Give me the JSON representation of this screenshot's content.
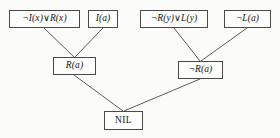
{
  "figure": {
    "type": "resolution-refutation-tree",
    "background_color": "#fbfbfa",
    "line_color": "#4a4a4a",
    "text_color": "#161616"
  },
  "nodes": {
    "clause1": {
      "label": "¬I(x)∨R(x)",
      "row": "premises"
    },
    "clause2": {
      "label": "I(a)",
      "row": "premises"
    },
    "clause3": {
      "label": "¬R(y)∨L(y)",
      "row": "premises"
    },
    "clause4": {
      "label": "¬L(a)",
      "row": "premises"
    },
    "resolvent1": {
      "label": "R(a)",
      "row": "intermediate"
    },
    "resolvent2": {
      "label": "¬R(a)",
      "row": "intermediate"
    },
    "nil": {
      "label": "NIL",
      "row": "conclusion"
    }
  },
  "edges": [
    {
      "from": "clause1",
      "to": "resolvent1",
      "x1": 44,
      "y1": 28,
      "x2": 74,
      "y2": 57
    },
    {
      "from": "clause2",
      "to": "resolvent1",
      "x1": 103,
      "y1": 28,
      "x2": 75,
      "y2": 57
    },
    {
      "from": "clause3",
      "to": "resolvent2",
      "x1": 174,
      "y1": 28,
      "x2": 200,
      "y2": 61
    },
    {
      "from": "clause4",
      "to": "resolvent2",
      "x1": 247,
      "y1": 28,
      "x2": 201,
      "y2": 61
    },
    {
      "from": "resolvent1",
      "to": "nil",
      "x1": 74,
      "y1": 75,
      "x2": 123,
      "y2": 111
    },
    {
      "from": "resolvent2",
      "to": "nil",
      "x1": 200,
      "y1": 79,
      "x2": 124,
      "y2": 111
    }
  ]
}
